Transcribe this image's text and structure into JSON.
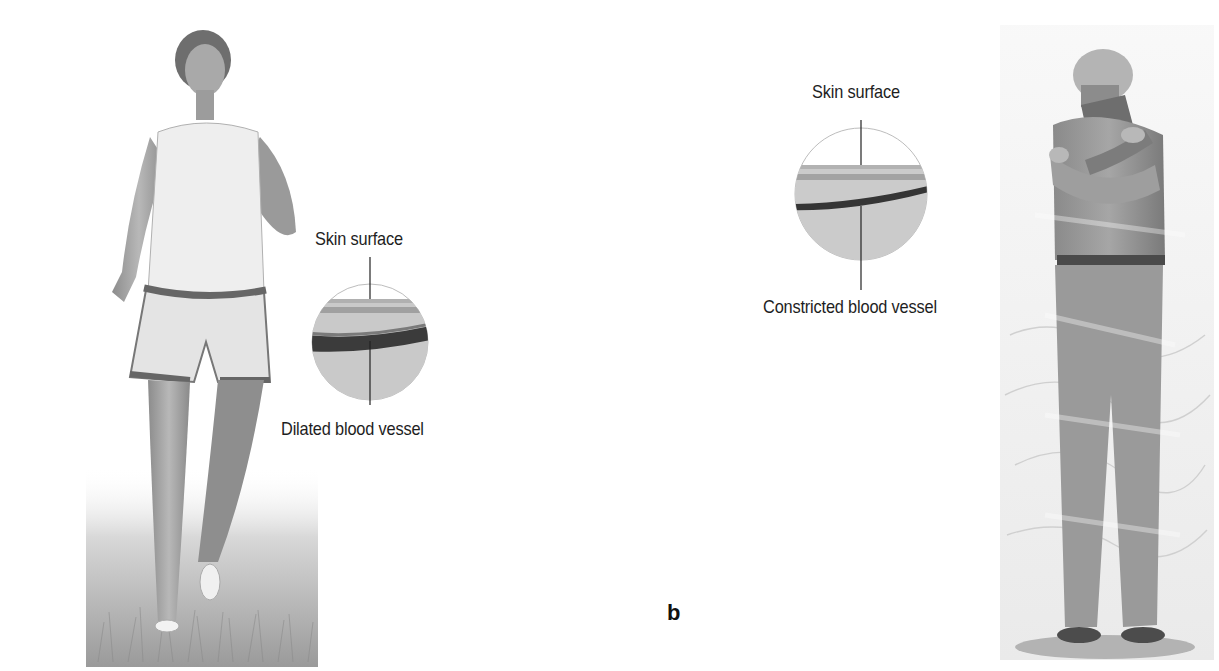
{
  "figure": {
    "panel_label": "b",
    "left_scene": {
      "subject": "runner-woman-in-grass",
      "condition": "warm / exercising",
      "inset": {
        "top_label": "Skin surface",
        "bottom_label": "Dilated blood vessel",
        "vessel_state": "dilated"
      }
    },
    "right_scene": {
      "subject": "cold-man-hugging-himself",
      "condition": "cold / shivering",
      "inset": {
        "top_label": "Skin surface",
        "bottom_label": "Constricted blood vessel",
        "vessel_state": "constricted"
      }
    },
    "colors": {
      "background": "#ffffff",
      "text": "#1e1e1e",
      "skin_tissue": "#c8c8c8",
      "vessel_dark": "#3a3a3a",
      "leader_line": "#222222"
    }
  }
}
